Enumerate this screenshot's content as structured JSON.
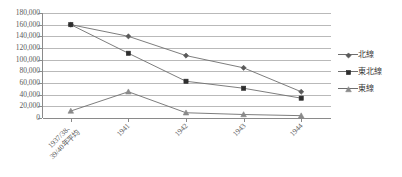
{
  "chart_data": {
    "type": "line",
    "title": "",
    "xlabel": "",
    "ylabel": "",
    "ylim": [
      0,
      180000
    ],
    "ytick_step": 20000,
    "grid": true,
    "legend_position": "right",
    "categories": [
      "1937/38、\n39/40年平均",
      "1941",
      "1942",
      "1943",
      "1944"
    ],
    "category_lines": [
      [
        "1937/38、",
        "39/40年平均"
      ],
      [
        "1941"
      ],
      [
        "1942"
      ],
      [
        "1943"
      ],
      [
        "1944"
      ]
    ],
    "ytick_labels": [
      "180,000",
      "160,000",
      "140,000",
      "120,000",
      "100,000",
      "80,000",
      "60,000",
      "40,000",
      "20,000",
      "0"
    ],
    "series": [
      {
        "name": "北線",
        "marker": "diamond",
        "color": "#5a5a5a",
        "values": [
          160000,
          140000,
          107000,
          86000,
          45000
        ]
      },
      {
        "name": "東北線",
        "marker": "square",
        "color": "#2e2e2e",
        "values": [
          160000,
          111000,
          63000,
          51000,
          34000
        ]
      },
      {
        "name": "東線",
        "marker": "triangle",
        "color": "#8a8a8a",
        "values": [
          12000,
          45000,
          9000,
          6000,
          4000
        ]
      }
    ]
  },
  "legend": {
    "items": [
      {
        "label": "北線"
      },
      {
        "label": "東北線"
      },
      {
        "label": "東線"
      }
    ]
  }
}
